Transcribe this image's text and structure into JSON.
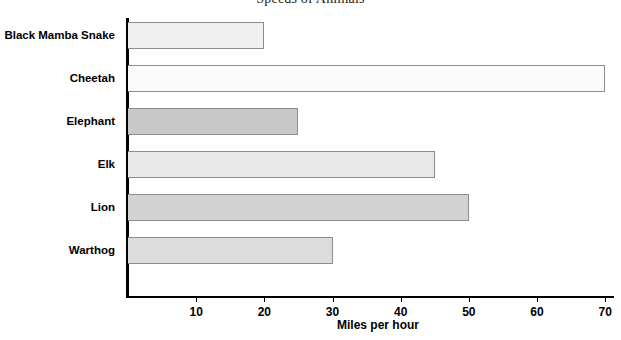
{
  "chart_data": {
    "type": "bar",
    "orientation": "horizontal",
    "title": "Speeds of Animals",
    "xlabel": "Miles per hour",
    "ylabel": "",
    "categories": [
      "Black Mamba Snake",
      "Cheetah",
      "Elephant",
      "Elk",
      "Lion",
      "Warthog"
    ],
    "values": [
      20,
      70,
      25,
      45,
      50,
      30
    ],
    "xlim": [
      0,
      71
    ],
    "xticks": [
      10,
      20,
      30,
      40,
      50,
      60,
      70
    ],
    "xtick_labels": [
      "10",
      "20",
      "30",
      "40",
      "50",
      "60",
      "70"
    ],
    "grid": false,
    "legend": false,
    "bar_colors": [
      "#f0f0f0",
      "#fbfbfb",
      "#c8c8c8",
      "#e8e8e8",
      "#d2d2d2",
      "#dcdcdc"
    ],
    "bar_border_color": "#8c8c8c",
    "axis_color": "#000000",
    "background_color": "#ffffff"
  }
}
